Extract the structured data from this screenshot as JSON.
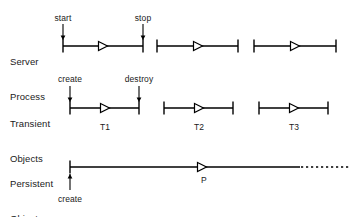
{
  "figure": {
    "background": "#ffffff",
    "stroke": "#000000",
    "text_color": "#1a1a1a",
    "width": 362,
    "height": 217
  },
  "rows": [
    {
      "id": "server-process",
      "label_line1": "Server",
      "label_line2": "Process",
      "label_x": 10,
      "label_y": 33,
      "line_y": 46,
      "segments": [
        {
          "id": "server-seg-1",
          "x1": 63,
          "x2": 143,
          "arrow_x": 103,
          "caption": ""
        },
        {
          "id": "server-seg-2",
          "x1": 157,
          "x2": 238,
          "arrow_x": 198,
          "caption": ""
        },
        {
          "id": "server-seg-3",
          "x1": 254,
          "x2": 336,
          "arrow_x": 295,
          "caption": ""
        }
      ],
      "annotations": [
        {
          "id": "start",
          "text": "start",
          "x": 63,
          "text_y": 13,
          "direction": "down",
          "arrow_from_y": 24,
          "arrow_to_y": 40
        },
        {
          "id": "stop",
          "text": "stop",
          "x": 143,
          "text_y": 13,
          "direction": "down",
          "arrow_from_y": 24,
          "arrow_to_y": 40
        }
      ]
    },
    {
      "id": "transient-objects",
      "label_line1": "Transient",
      "label_line2": "Objects",
      "label_x": 10,
      "label_y": 95,
      "line_y": 108,
      "segments": [
        {
          "id": "transient-seg-1",
          "x1": 70,
          "x2": 139,
          "arrow_x": 105,
          "caption": "T1"
        },
        {
          "id": "transient-seg-2",
          "x1": 164,
          "x2": 233,
          "arrow_x": 199,
          "caption": "T2"
        },
        {
          "id": "transient-seg-3",
          "x1": 259,
          "x2": 328,
          "arrow_x": 294,
          "caption": "T3"
        }
      ],
      "annotations": [
        {
          "id": "create",
          "text": "create",
          "x": 70,
          "text_y": 74,
          "direction": "down",
          "arrow_from_y": 86,
          "arrow_to_y": 102
        },
        {
          "id": "destroy",
          "text": "destroy",
          "x": 139,
          "text_y": 74,
          "direction": "down",
          "arrow_from_y": 86,
          "arrow_to_y": 102
        }
      ],
      "caption_y": 122
    },
    {
      "id": "persistent-object",
      "label_line1": "Persistent",
      "label_line2": "Object",
      "label_x": 10,
      "label_y": 155,
      "line_y": 167,
      "segments": [
        {
          "id": "persistent-seg-1",
          "x1": 70,
          "x2": 300,
          "arrow_x": 202,
          "caption": "P"
        }
      ],
      "dashed": {
        "id": "persistent-dashed-tail",
        "x1": 301,
        "x2": 349
      },
      "annotations": [
        {
          "id": "create-bottom",
          "text": "create",
          "x": 70,
          "text_y": 194,
          "direction": "up",
          "arrow_from_y": 190,
          "arrow_to_y": 174
        }
      ],
      "caption_y": 175,
      "left_cap_only": true
    }
  ],
  "legend": {
    "arrow_glyph": "hollow-triangle-right",
    "tick_glyph": "vertical-bar-cap",
    "dash_glyph": "dashed-line"
  }
}
